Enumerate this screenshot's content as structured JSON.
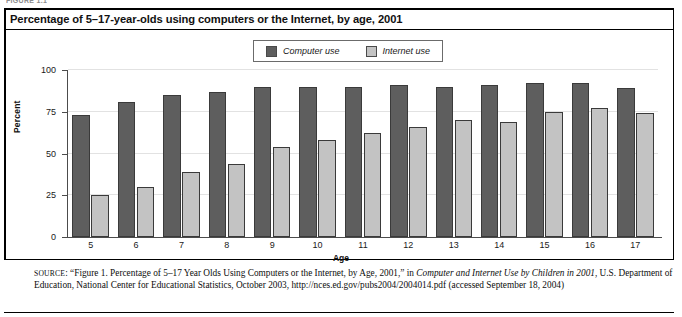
{
  "page": {
    "top_cropped_label": "FIGURE 1.1"
  },
  "figure": {
    "title": "Percentage of 5–17-year-olds using computers or the Internet, by age, 2001"
  },
  "legend": {
    "position": "top-center",
    "items": [
      {
        "label": "Computer use",
        "color": "#5e5e5e",
        "swatch_name": "legend-swatch-computer-use"
      },
      {
        "label": "Internet use",
        "color": "#c3c3c3",
        "swatch_name": "legend-swatch-internet-use"
      }
    ]
  },
  "source": {
    "label": "SOURCE",
    "prefix": ": “Figure 1. Percentage of 5–17 Year Olds Using Computers or the Internet, by Age, 2001,” in ",
    "italic_title": "Computer and Internet Use by Children in 2001",
    "suffix": ", U.S. Department of Education, National Center for Educational Statistics, October 2003, http://nces.ed.gov/pubs2004/2004014.pdf (accessed September 18, 2004)"
  },
  "chart_data": {
    "type": "bar",
    "title": "Percentage of 5–17-year-olds using computers or the Internet, by age, 2001",
    "xlabel": "Age",
    "ylabel": "Percent",
    "ylim": [
      0,
      100
    ],
    "yticks": [
      0,
      25,
      50,
      75,
      100
    ],
    "grid": true,
    "legend_position": "top-center",
    "categories": [
      "5",
      "6",
      "7",
      "8",
      "9",
      "10",
      "11",
      "12",
      "13",
      "14",
      "15",
      "16",
      "17"
    ],
    "series": [
      {
        "name": "Computer use",
        "color": "#5e5e5e",
        "values": [
          73,
          81,
          85,
          87,
          90,
          90,
          90,
          91,
          90,
          91,
          92,
          92,
          89
        ]
      },
      {
        "name": "Internet use",
        "color": "#c3c3c3",
        "values": [
          25,
          30,
          39,
          44,
          54,
          58,
          62,
          66,
          70,
          69,
          75,
          77,
          74
        ]
      }
    ]
  }
}
